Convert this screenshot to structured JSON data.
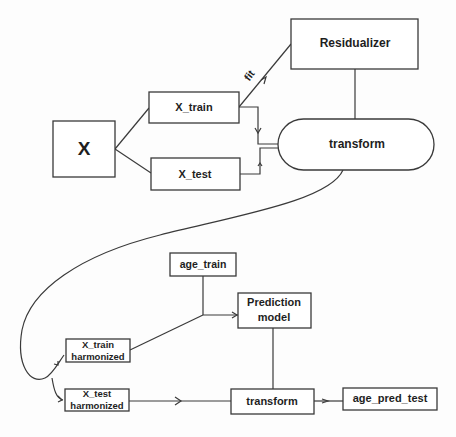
{
  "diagram": {
    "nodes": {
      "x": {
        "label": "X"
      },
      "x_train": {
        "label": "X_train"
      },
      "x_test": {
        "label": "X_test"
      },
      "residualizer": {
        "label": "Residualizer"
      },
      "transform_top": {
        "label": "transform"
      },
      "age_train": {
        "label": "age_train"
      },
      "prediction_model": {
        "line1": "Prediction",
        "line2": "model"
      },
      "x_train_harmonized": {
        "line1": "X_train",
        "line2": "harmonized"
      },
      "x_test_harmonized": {
        "line1": "X_test",
        "line2": "harmonized"
      },
      "transform_bottom": {
        "label": "transform"
      },
      "age_pred_test": {
        "label": "age_pred_test"
      }
    },
    "edge_labels": {
      "fit": "fit"
    },
    "edges": [
      {
        "from": "X",
        "to": "X_train"
      },
      {
        "from": "X",
        "to": "X_test"
      },
      {
        "from": "X_train",
        "to": "Residualizer",
        "label": "fit"
      },
      {
        "from": "Residualizer",
        "to": "transform"
      },
      {
        "from": "X_train",
        "to": "transform"
      },
      {
        "from": "X_test",
        "to": "transform"
      },
      {
        "from": "transform",
        "to": "X_train harmonized"
      },
      {
        "from": "transform",
        "to": "X_test harmonized"
      },
      {
        "from": "age_train",
        "to": "Prediction model"
      },
      {
        "from": "X_train harmonized",
        "to": "Prediction model"
      },
      {
        "from": "Prediction model",
        "to": "transform (bottom)"
      },
      {
        "from": "X_test harmonized",
        "to": "transform (bottom)"
      },
      {
        "from": "transform (bottom)",
        "to": "age_pred_test"
      }
    ]
  }
}
